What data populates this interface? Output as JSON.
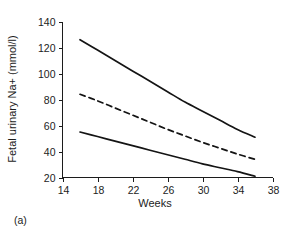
{
  "caption": "(a)",
  "chart_data": {
    "type": "line",
    "title": "",
    "xlabel": "Weeks",
    "ylabel": "Fetal urinary Na+ (mmol/l)",
    "xlim": [
      14,
      38
    ],
    "ylim": [
      20,
      140
    ],
    "xticks": [
      14,
      18,
      22,
      26,
      30,
      34,
      38
    ],
    "yticks": [
      20,
      40,
      60,
      80,
      100,
      120,
      140
    ],
    "grid": false,
    "legend": "none",
    "series": [
      {
        "name": "upper-limit",
        "style": "solid",
        "color": "#141414",
        "x": [
          16,
          18,
          20,
          22,
          24,
          26,
          28,
          30,
          32,
          34,
          36
        ],
        "values": [
          126,
          118,
          110,
          102,
          94,
          86,
          78,
          71,
          64,
          57,
          51
        ]
      },
      {
        "name": "mean",
        "style": "dashed",
        "color": "#141414",
        "x": [
          16,
          18,
          20,
          22,
          24,
          26,
          28,
          30,
          32,
          34,
          36
        ],
        "values": [
          84,
          79,
          73.5,
          68,
          62.5,
          57,
          52,
          47,
          42.5,
          38,
          34
        ]
      },
      {
        "name": "lower-limit",
        "style": "solid",
        "color": "#141414",
        "x": [
          16,
          18,
          20,
          22,
          24,
          26,
          28,
          30,
          32,
          34,
          36
        ],
        "values": [
          55,
          51.5,
          48,
          44.5,
          41,
          37.5,
          34,
          30.5,
          27.5,
          24.5,
          21
        ]
      }
    ]
  },
  "axis": {
    "y_title": "Fetal urinary Na+ (mmol/l)",
    "x_title": "Weeks",
    "x_tick_labels": [
      "14",
      "18",
      "22",
      "26",
      "30",
      "34",
      "38"
    ],
    "y_tick_labels": [
      "20",
      "40",
      "60",
      "80",
      "100",
      "120",
      "140"
    ]
  }
}
